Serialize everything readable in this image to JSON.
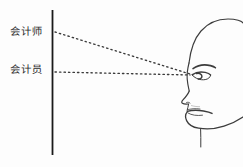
{
  "figure": {
    "kind": "line-drawing-diagram",
    "background_color": "#fdfdfd",
    "ink_color": "#2b2b2b",
    "width": 243,
    "height": 167
  },
  "labels": {
    "upper": "会计师",
    "lower": "会计员"
  },
  "axis": {
    "name": "vertical-reference-line",
    "x": 52,
    "y_top": 10,
    "y_bottom": 155,
    "color": "#1a1a1a"
  },
  "sight_lines": [
    {
      "name": "upper-sight-line",
      "label": "会计师",
      "style": "dotted",
      "from": [
        55,
        32
      ],
      "to": [
        190,
        74
      ],
      "color": "#3a3a3a"
    },
    {
      "name": "lower-sight-line",
      "label": "会计员",
      "style": "dotted",
      "from": [
        55,
        72
      ],
      "to": [
        190,
        75
      ],
      "color": "#3a3a3a"
    }
  ],
  "head": {
    "name": "profile-head",
    "facing": "left",
    "vertex": [
      190,
      74
    ],
    "parts": [
      "forehead",
      "brow-ridge",
      "eyebrow",
      "eye",
      "nose",
      "upper-lip",
      "lower-lip",
      "chin",
      "jaw",
      "neck",
      "skull-crown"
    ],
    "color": "#3c3c3c"
  }
}
